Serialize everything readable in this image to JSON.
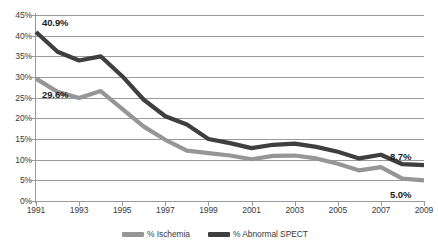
{
  "chart_data": {
    "type": "line",
    "title": "",
    "xlabel": "",
    "ylabel": "",
    "ylim": [
      0,
      45
    ],
    "xlim": [
      1991,
      2009
    ],
    "grid": true,
    "legend_position": "bottom",
    "y_ticks": [
      "0%",
      "5%",
      "10%",
      "15%",
      "20%",
      "25%",
      "30%",
      "35%",
      "40%",
      "45%"
    ],
    "y_tick_values": [
      0,
      5,
      10,
      15,
      20,
      25,
      30,
      35,
      40,
      45
    ],
    "x_tick_labels": [
      "1991",
      "1993",
      "1995",
      "1997",
      "1999",
      "2001",
      "2003",
      "2005",
      "2007",
      "2009"
    ],
    "x": [
      1991,
      1992,
      1993,
      1994,
      1995,
      1996,
      1997,
      1998,
      1999,
      2000,
      2001,
      2002,
      2003,
      2004,
      2005,
      2006,
      2007,
      2008,
      2009
    ],
    "series": [
      {
        "name": "% Ischemia",
        "color": "#969696",
        "values": [
          29.6,
          26.4,
          24.9,
          26.6,
          22.3,
          18.0,
          14.8,
          12.2,
          11.6,
          11.0,
          10.1,
          10.9,
          11.0,
          10.3,
          9.0,
          7.4,
          8.2,
          5.4,
          5.0
        ]
      },
      {
        "name": "% Abnormal SPECT",
        "color": "#3f3f3f",
        "values": [
          40.9,
          36.1,
          34.0,
          35.0,
          30.2,
          24.5,
          20.5,
          18.5,
          15.0,
          14.0,
          12.8,
          13.6,
          13.9,
          13.1,
          11.9,
          10.3,
          11.2,
          8.9,
          8.7
        ]
      }
    ],
    "annotations": [
      {
        "name": "first-abnormal-spect-label",
        "text": "40.9%",
        "x": 1991,
        "y": 40.9
      },
      {
        "name": "first-ischemia-label",
        "text": "29.6%",
        "x": 1991,
        "y": 29.6
      },
      {
        "name": "last-abnormal-spect-label",
        "text": "8.7%",
        "x": 2009,
        "y": 8.7
      },
      {
        "name": "last-ischemia-label",
        "text": "5.0%",
        "x": 2009,
        "y": 5.0
      }
    ],
    "legend": [
      {
        "label": "% Ischemia",
        "color": "#969696"
      },
      {
        "label": "% Abnormal SPECT",
        "color": "#3f3f3f"
      }
    ]
  }
}
